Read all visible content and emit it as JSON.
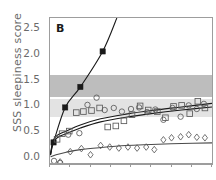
{
  "chart_data": {
    "type": "scatter",
    "title": "",
    "panel_label": "B",
    "xlabel": "",
    "ylabel": "SSS sleepiness score",
    "ylim": [
      -0.12,
      2.72
    ],
    "xlim": [
      0,
      16
    ],
    "yticks": [
      0.0,
      0.5,
      1.0,
      1.5,
      2.0,
      2.5
    ],
    "ytick_labels": [
      "0.0",
      "0.5",
      "1.0",
      "1.5",
      "2.0",
      "2.5"
    ],
    "xticks": [
      0,
      2,
      4,
      6,
      8,
      10,
      12,
      14,
      16
    ],
    "xtick_labels": [
      "",
      "",
      "",
      "",
      "",
      "",
      "",
      "",
      ""
    ],
    "grid": false,
    "legend_position": "none",
    "bands": [
      {
        "name": "dark-band",
        "y0": 1.19,
        "y1": 1.62,
        "color": "#bdbdbd"
      },
      {
        "name": "light-band",
        "y0": 0.79,
        "y1": 1.15,
        "color": "#e3e3e3"
      }
    ],
    "series": [
      {
        "name": "filled-squares",
        "marker": "filled-square",
        "color": "#1a1a1a",
        "x": [
          0.35,
          1.5,
          3.0,
          5.2
        ],
        "y": [
          0.3,
          0.98,
          1.38,
          2.07
        ]
      },
      {
        "name": "open-squares",
        "marker": "open-square",
        "color": "#5a5a5a",
        "x": [
          0.7,
          1.2,
          1.9,
          2.6,
          3.3,
          4.1,
          4.9,
          5.7,
          6.5,
          7.3,
          8.1,
          8.9,
          9.7,
          10.6,
          11.4,
          12.2,
          13.0,
          13.8,
          14.6,
          15.3
        ],
        "y": [
          0.36,
          0.47,
          0.52,
          0.88,
          0.9,
          0.92,
          0.97,
          0.6,
          0.62,
          0.72,
          0.84,
          1.01,
          0.93,
          0.9,
          0.78,
          1.0,
          1.02,
          0.86,
          1.1,
          0.97
        ]
      },
      {
        "name": "open-circles",
        "marker": "open-circle",
        "color": "#5a5a5a",
        "x": [
          0.4,
          1.0,
          1.8,
          2.9,
          3.7,
          4.6,
          5.4,
          6.3,
          7.1,
          8.0,
          8.8,
          9.6,
          10.4,
          11.2,
          12.1,
          12.9,
          13.7,
          14.5,
          15.2
        ],
        "y": [
          -0.06,
          -0.1,
          0.45,
          0.48,
          1.03,
          1.17,
          0.93,
          0.97,
          0.9,
          0.95,
          0.98,
          0.89,
          0.94,
          0.74,
          0.97,
          0.8,
          1.02,
          0.95,
          1.05
        ]
      },
      {
        "name": "open-diamonds",
        "marker": "open-diamond",
        "color": "#5a5a5a",
        "x": [
          1.0,
          2.0,
          3.1,
          4.0,
          5.0,
          5.9,
          6.8,
          7.7,
          8.6,
          9.5,
          10.3,
          11.2,
          12.0,
          12.9,
          13.7,
          14.5,
          15.3
        ],
        "y": [
          -0.08,
          0.12,
          0.18,
          0.06,
          0.24,
          0.21,
          0.19,
          0.21,
          0.19,
          0.21,
          0.16,
          0.35,
          0.39,
          0.41,
          0.45,
          0.4,
          0.39
        ]
      }
    ],
    "fit_curves": [
      {
        "name": "steep-linear-fit",
        "type": "line",
        "color": "#1a1a1a",
        "points": [
          [
            0.05,
            0.06
          ],
          [
            0.35,
            0.3
          ],
          [
            1.5,
            0.98
          ],
          [
            3.0,
            1.38
          ],
          [
            5.2,
            2.07
          ],
          [
            6.6,
            2.72
          ]
        ]
      },
      {
        "name": "upper-log-fit-a",
        "type": "log",
        "color": "#1a1a1a",
        "points": [
          [
            0.05,
            0.07
          ],
          [
            0.3,
            0.34
          ],
          [
            0.8,
            0.45
          ],
          [
            1.6,
            0.52
          ],
          [
            3.0,
            0.64
          ],
          [
            5.0,
            0.76
          ],
          [
            7.5,
            0.85
          ],
          [
            10.0,
            0.92
          ],
          [
            13.0,
            0.99
          ],
          [
            16.0,
            1.06
          ]
        ]
      },
      {
        "name": "upper-log-fit-b",
        "type": "log",
        "color": "#1a1a1a",
        "points": [
          [
            0.05,
            0.05
          ],
          [
            0.3,
            0.3
          ],
          [
            0.8,
            0.4
          ],
          [
            1.6,
            0.47
          ],
          [
            3.0,
            0.58
          ],
          [
            5.0,
            0.7
          ],
          [
            7.5,
            0.79
          ],
          [
            10.0,
            0.86
          ],
          [
            13.0,
            0.93
          ],
          [
            16.0,
            0.99
          ]
        ]
      },
      {
        "name": "lower-log-fit",
        "type": "log",
        "color": "#4a4a4a",
        "points": [
          [
            0.05,
            0.02
          ],
          [
            0.6,
            0.06
          ],
          [
            1.6,
            0.11
          ],
          [
            3.0,
            0.16
          ],
          [
            5.0,
            0.2
          ],
          [
            7.5,
            0.24
          ],
          [
            10.0,
            0.26
          ],
          [
            13.0,
            0.28
          ],
          [
            16.0,
            0.29
          ]
        ]
      }
    ]
  }
}
